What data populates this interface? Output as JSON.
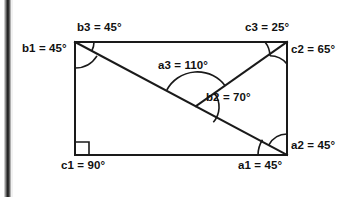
{
  "figure": {
    "type": "geometry-diagram",
    "shape": "rectangle",
    "rectangle": {
      "x": 75,
      "y": 42,
      "width": 212,
      "height": 113
    },
    "lines": [
      {
        "name": "diagonal-main",
        "from": "top-left-corner",
        "to": "bottom-right-corner"
      },
      {
        "name": "segment-to-top-right",
        "from": "interior-intersection",
        "to": "top-right-corner"
      }
    ],
    "intersection_point": {
      "x": 198,
      "y": 105
    }
  },
  "labels": {
    "b3": "b3 = 45°",
    "c3": "c3 = 25°",
    "b1": "b1 = 45°",
    "c2": "c2 = 65°",
    "a3": "a3 = 110°",
    "b2": "b2 = 70°",
    "a2": "a2 = 45°",
    "c1": "c1 = 90°",
    "a1": "a1 = 45°"
  },
  "angles": [
    {
      "id": "b1",
      "value": 45,
      "unit": "degrees",
      "vertex": "top-left-corner",
      "between": [
        "left-edge",
        "diagonal"
      ]
    },
    {
      "id": "b3",
      "value": 45,
      "unit": "degrees",
      "vertex": "top-left-corner",
      "between": [
        "diagonal",
        "top-edge"
      ]
    },
    {
      "id": "c3",
      "value": 25,
      "unit": "degrees",
      "vertex": "top-right-corner",
      "between": [
        "top-edge",
        "segment-to-top-right"
      ]
    },
    {
      "id": "c2",
      "value": 65,
      "unit": "degrees",
      "vertex": "top-right-corner",
      "between": [
        "segment-to-top-right",
        "right-edge"
      ]
    },
    {
      "id": "a3",
      "value": 110,
      "unit": "degrees",
      "vertex": "interior-intersection",
      "between": [
        "diagonal-upper",
        "segment-to-top-right"
      ]
    },
    {
      "id": "b2",
      "value": 70,
      "unit": "degrees",
      "vertex": "interior-intersection",
      "between": [
        "segment-to-top-right",
        "diagonal-lower"
      ]
    },
    {
      "id": "a2",
      "value": 45,
      "unit": "degrees",
      "vertex": "bottom-right-corner",
      "between": [
        "diagonal",
        "right-edge"
      ]
    },
    {
      "id": "a1",
      "value": 45,
      "unit": "degrees",
      "vertex": "bottom-right-corner",
      "between": [
        "bottom-edge",
        "diagonal"
      ]
    },
    {
      "id": "c1",
      "value": 90,
      "unit": "degrees",
      "vertex": "bottom-left-corner",
      "between": [
        "bottom-edge",
        "left-edge"
      ],
      "marker": "right-angle-square"
    }
  ],
  "colors": {
    "stroke": "#1a1a1a",
    "text": "#111111",
    "background": "#ffffff",
    "page_edge": "#1d1d1d"
  }
}
